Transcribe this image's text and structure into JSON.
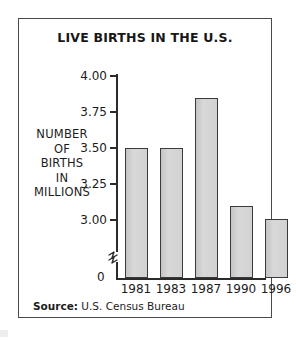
{
  "figure": {
    "title": "LIVE BIRTHS IN THE U.S.",
    "y_axis_caption_lines": [
      "NUMBER",
      "OF",
      "BIRTHS",
      "IN",
      "MILLIONS"
    ],
    "zero_label": "0",
    "source_label": "Source:",
    "source_value": "U.S. Census Bureau",
    "break_icon": "axis-break-icon",
    "colors": {
      "bar_fill": "#cfcfcf",
      "bar_border": "#3a3a3a",
      "axis": "#2b2b2b",
      "frame": "#4a4a4a",
      "text": "#1c1c1c"
    }
  },
  "chart_data": {
    "type": "bar",
    "title": "LIVE BIRTHS IN THE U.S.",
    "xlabel": "",
    "ylabel": "NUMBER OF BIRTHS IN MILLIONS",
    "categories": [
      "1981",
      "1983",
      "1987",
      "1990",
      "1996"
    ],
    "values": [
      3.5,
      3.5,
      3.85,
      3.1,
      3.01
    ],
    "ylim": [
      2.9375,
      4.0
    ],
    "yticks": [
      3.0,
      3.25,
      3.5,
      3.75,
      4.0
    ],
    "ytick_labels": [
      "3.00",
      "3.25",
      "3.50",
      "3.75",
      "4.00"
    ],
    "axis_break": true,
    "axis_break_base_label": "0",
    "grid": false,
    "legend": false,
    "source": "Source: U.S. Census Bureau"
  }
}
